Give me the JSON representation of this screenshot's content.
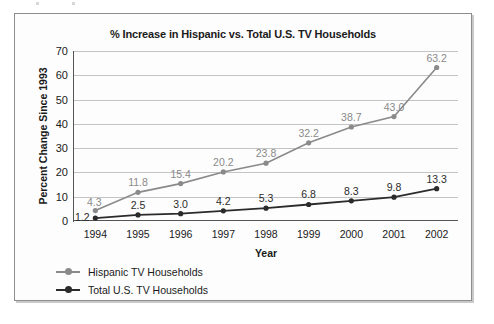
{
  "chart_data": {
    "type": "line",
    "title": "% Increase in Hispanic vs. Total U.S. TV Households",
    "xlabel": "Year",
    "ylabel": "Percent Change Since 1993",
    "categories": [
      "1994",
      "1995",
      "1996",
      "1997",
      "1998",
      "1999",
      "2000",
      "2001",
      "2002"
    ],
    "ylim": [
      0,
      70
    ],
    "yticks": [
      "0",
      "10",
      "20",
      "30",
      "40",
      "50",
      "60",
      "70"
    ],
    "grid": "horizontal",
    "legend_position": "bottom-left",
    "series": [
      {
        "name": "Hispanic TV Households",
        "color": "#8a8a8a",
        "values": [
          4.3,
          11.8,
          15.4,
          20.2,
          23.8,
          32.2,
          38.7,
          43.0,
          63.2
        ],
        "labels": [
          "4.3",
          "11.8",
          "15.4",
          "20.2",
          "23.8",
          "32.2",
          "38.7",
          "43.0",
          "63.2"
        ]
      },
      {
        "name": "Total U.S. TV Households",
        "color": "#2b2b2b",
        "values": [
          1.2,
          2.5,
          3.0,
          4.2,
          5.3,
          6.8,
          8.3,
          9.8,
          13.3
        ],
        "labels": [
          "1.2",
          "2.5",
          "3.0",
          "4.2",
          "5.3",
          "6.8",
          "8.3",
          "9.8",
          "13.3"
        ]
      }
    ]
  },
  "legend": {
    "items": [
      {
        "label": "Hispanic TV Households",
        "color": "#8a8a8a"
      },
      {
        "label": "Total U.S. TV Households",
        "color": "#2b2b2b"
      }
    ]
  }
}
